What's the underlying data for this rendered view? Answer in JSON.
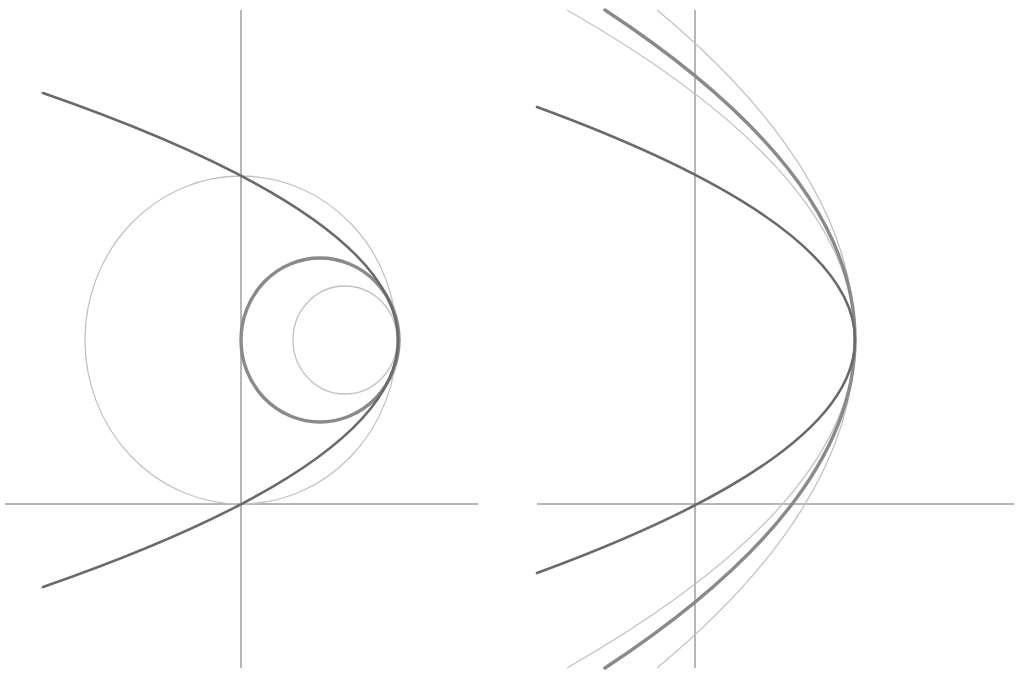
{
  "figure": {
    "panels": [
      {
        "id": "left",
        "description": "Parabola opening left through the origin, with three tangent circles at its vertex",
        "axes": {
          "x_axis": {
            "x1": 5,
            "x2": 478,
            "y": 504
          },
          "y_axis": {
            "x": 241,
            "y1": 10,
            "y2": 668
          }
        },
        "curves": [
          {
            "name": "parabola",
            "style": "dark",
            "vertex": [
              398,
              340
            ],
            "endpoints": [
              [
                43,
                93
              ],
              [
                43,
                587
              ]
            ]
          },
          {
            "name": "large-circle",
            "style": "light",
            "center": [
              241,
              340
            ],
            "rx": 156,
            "ry": 164
          },
          {
            "name": "osculating-circle",
            "style": "medium",
            "center": [
              320,
              340
            ],
            "rx": 79,
            "ry": 82
          },
          {
            "name": "small-circle",
            "style": "light",
            "center": [
              345,
              340
            ],
            "rx": 52,
            "ry": 54
          }
        ]
      },
      {
        "id": "right",
        "description": "Parabola opening left through the origin, with three nested curves sharing its vertex",
        "axes": {
          "x_axis": {
            "x1": 537,
            "x2": 1014,
            "y": 504
          },
          "y_axis": {
            "x": 695,
            "y1": 10,
            "y2": 668
          }
        },
        "curves": [
          {
            "name": "parabola",
            "style": "dark",
            "vertex": [
              855,
              340
            ],
            "endpoints": [
              [
                537,
                107
              ],
              [
                537,
                573
              ]
            ]
          },
          {
            "name": "inner-light-curve",
            "style": "light",
            "vertex": [
              855,
              339
            ],
            "endpoints": [
              [
                567,
                10
              ],
              [
                567,
                668
              ]
            ]
          },
          {
            "name": "thick-curve",
            "style": "medium",
            "vertex": [
              855,
              339
            ],
            "endpoints": [
              [
                605,
                10
              ],
              [
                605,
                668
              ]
            ]
          },
          {
            "name": "outer-light-curve",
            "style": "light",
            "vertex": [
              855,
              339
            ],
            "endpoints": [
              [
                657,
                10
              ],
              [
                657,
                668
              ]
            ]
          }
        ]
      }
    ],
    "colors": {
      "background": "#ffffff",
      "axis": "#6e6e6e",
      "dark": "#6a6a6a",
      "medium": "#8a8a8a",
      "light": "#c2c2c2"
    }
  }
}
